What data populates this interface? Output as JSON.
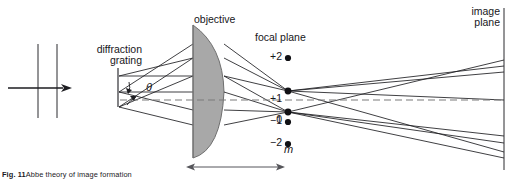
{
  "figure": {
    "domain": "Diagram",
    "title_caption_prefix": "Fig. 11",
    "caption_body": "Abbe theory of image formation",
    "labels": {
      "diffraction_grating": "diffraction\ngrating",
      "objective": "objective",
      "focal_plane": "focal plane",
      "image_plane": "image\nplane",
      "theta": "θ",
      "order_variable": "m"
    },
    "diffraction_orders": [
      {
        "label": "+2",
        "m": 2,
        "y": 58,
        "dot": true,
        "dot_x": 288
      },
      {
        "label": "+1",
        "m": 1,
        "y": 91,
        "dot": true,
        "dot_x": 288
      },
      {
        "label": "0",
        "m": 0,
        "y": 112,
        "dot": true,
        "dot_x": 288
      },
      {
        "label": "−1",
        "m": -1,
        "y": 122,
        "dot": true,
        "dot_x": 288
      },
      {
        "label": "−2",
        "m": -2,
        "y": 144,
        "dot": true,
        "dot_x": 288
      }
    ],
    "colors": {
      "ink": "#17161a",
      "lens_fill": "#a8a8a8",
      "lens_stroke": "#6f6f6f",
      "axis_dash": "#7a7a7a",
      "background": "#ffffff"
    },
    "geometry": {
      "grating_x": 118,
      "lens_flat_x": 193,
      "lens_apex_x": 224,
      "focal_plane_x": 288,
      "image_plane_x": 504,
      "optical_axis_y": 100,
      "focal_distance_arrow": {
        "x1": 188,
        "x2": 283,
        "y": 167
      }
    }
  }
}
